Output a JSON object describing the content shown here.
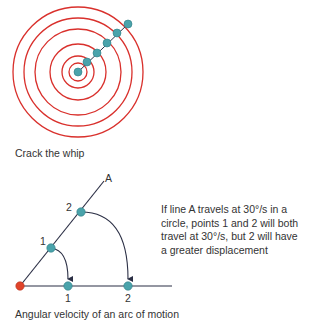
{
  "colors": {
    "ring": "#d9302c",
    "dot": "#4aa3ab",
    "dot_stroke": "#2f7d84",
    "line": "#2b2f45",
    "origin": "#e0442a",
    "text": "#333333"
  },
  "whip": {
    "caption": "Crack the whip",
    "center": [
      78,
      72
    ],
    "ring_radii": [
      65,
      54,
      43,
      28,
      16,
      9
    ],
    "dots": [
      [
        78,
        72
      ],
      [
        87,
        62
      ],
      [
        97,
        53
      ],
      [
        107,
        43
      ],
      [
        117,
        33
      ],
      [
        128,
        24
      ]
    ]
  },
  "arc": {
    "caption": "Angular velocity of an arc of motion",
    "line_label": "A",
    "point1_label": "1",
    "point2_label": "2",
    "point1_base_label": "1",
    "point2_base_label": "2",
    "note_lines": [
      "If line A travels at 30°/s in a",
      "circle, points 1 and 2 will both",
      "travel at 30°/s, but 2 will have",
      "a greater displacement"
    ]
  }
}
